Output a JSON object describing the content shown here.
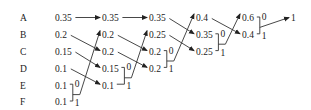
{
  "symbols": [
    "A",
    "B",
    "C",
    "D",
    "E",
    "F"
  ],
  "columns": [
    [
      "0.35",
      "0.2",
      "0.15",
      "0.1",
      "0.1",
      "0.1"
    ],
    [
      "0.35",
      "0.2",
      "0.2",
      "0.15",
      "0.1"
    ],
    [
      "0.35",
      "0.25",
      "0.2",
      "0.2"
    ],
    [
      "0.4",
      "0.35",
      "0.25"
    ],
    [
      "0.6",
      "0.4"
    ],
    [
      "1"
    ]
  ],
  "merges": [
    {
      "from_col": 0,
      "rows": [
        4,
        5
      ],
      "to_row": 1,
      "bits": [
        "0",
        "1"
      ]
    },
    {
      "from_col": 1,
      "rows": [
        3,
        4
      ],
      "to_row": 1,
      "bits": [
        "0",
        "1"
      ]
    },
    {
      "from_col": 2,
      "rows": [
        2,
        3
      ],
      "to_row": 0,
      "bits": [
        "0",
        "1"
      ]
    },
    {
      "from_col": 3,
      "rows": [
        1,
        2
      ],
      "to_row": 0,
      "bits": [
        "0",
        "1"
      ]
    },
    {
      "from_col": 4,
      "rows": [
        0,
        1
      ],
      "to_row": 0,
      "bits": [
        "0",
        "1"
      ]
    }
  ],
  "carries": [
    {
      "from_col": 0,
      "from_row": 0,
      "to_row": 0
    },
    {
      "from_col": 0,
      "from_row": 1,
      "to_row": 2
    },
    {
      "from_col": 0,
      "from_row": 2,
      "to_row": 3
    },
    {
      "from_col": 0,
      "from_row": 3,
      "to_row": 4
    },
    {
      "from_col": 1,
      "from_row": 0,
      "to_row": 0
    },
    {
      "from_col": 1,
      "from_row": 1,
      "to_row": 2
    },
    {
      "from_col": 1,
      "from_row": 2,
      "to_row": 3
    },
    {
      "from_col": 2,
      "from_row": 0,
      "to_row": 1
    },
    {
      "from_col": 2,
      "from_row": 1,
      "to_row": 2
    },
    {
      "from_col": 3,
      "from_row": 0,
      "to_row": 1
    }
  ]
}
